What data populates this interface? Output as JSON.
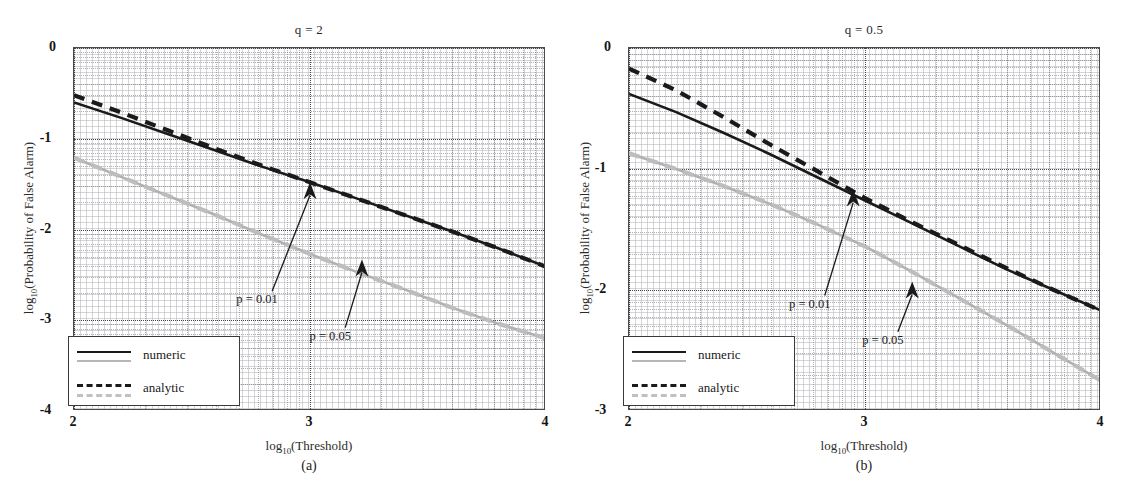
{
  "figure": {
    "width": 1137,
    "height": 485,
    "background": "#ffffff",
    "colors": {
      "numeric_black": "#1a1a1a",
      "numeric_gray": "#b0b0b0",
      "analytic_black": "#1a1a1a",
      "analytic_gray": "#bdbdbd",
      "axis": "#4a4a4a",
      "grid": "#787882",
      "text": "#1a1a1a"
    }
  },
  "chart_data": [
    {
      "type": "line",
      "panel": "a",
      "title": "q = 2",
      "subcaption": "(a)",
      "xlabel": "log10(Threshold)",
      "ylabel": "log10(Probability of False Alarm)",
      "xlim": [
        2,
        4
      ],
      "ylim": [
        -4,
        0
      ],
      "xticks": [
        2,
        3,
        4
      ],
      "xtick_labels": [
        "2",
        "3",
        "4"
      ],
      "yticks": [
        0,
        -1,
        -2,
        -3,
        -4
      ],
      "ytick_labels": [
        "0",
        "-1",
        "-2",
        "-3",
        "-4"
      ],
      "grid": "minor-dotted",
      "legend": {
        "position": "lower-left",
        "entries": [
          "numeric",
          "analytic"
        ]
      },
      "annotations": [
        {
          "text": "p = 0.01",
          "x": 2.78,
          "y": -2.78,
          "arrow_to_x": 3.0,
          "arrow_to_y": -1.48
        },
        {
          "text": "p = 0.05",
          "x": 3.09,
          "y": -3.18,
          "arrow_to_x": 3.22,
          "arrow_to_y": -2.33
        }
      ],
      "x": [
        2.0,
        2.2,
        2.4,
        2.6,
        2.8,
        3.0,
        3.2,
        3.4,
        3.6,
        3.8,
        4.0
      ],
      "series": [
        {
          "name": "numeric p=0.01",
          "color": "#1a1a1a",
          "style": "solid",
          "values": [
            -0.6,
            -0.77,
            -0.95,
            -1.13,
            -1.31,
            -1.48,
            -1.66,
            -1.84,
            -2.02,
            -2.21,
            -2.41
          ]
        },
        {
          "name": "analytic p=0.01",
          "color": "#1a1a1a",
          "style": "dashed",
          "values": [
            -0.52,
            -0.71,
            -0.91,
            -1.11,
            -1.3,
            -1.48,
            -1.66,
            -1.84,
            -2.02,
            -2.21,
            -2.41
          ]
        },
        {
          "name": "numeric p=0.05",
          "color": "#b0b0b0",
          "style": "solid",
          "values": [
            -1.21,
            -1.42,
            -1.63,
            -1.84,
            -2.06,
            -2.27,
            -2.47,
            -2.66,
            -2.86,
            -3.04,
            -3.2
          ]
        },
        {
          "name": "analytic p=0.05",
          "color": "#bdbdbd",
          "style": "dashed",
          "values": [
            -1.21,
            -1.42,
            -1.63,
            -1.84,
            -2.06,
            -2.27,
            -2.47,
            -2.66,
            -2.86,
            -3.04,
            -3.2
          ]
        }
      ]
    },
    {
      "type": "line",
      "panel": "b",
      "title": "q = 0.5",
      "subcaption": "(b)",
      "xlabel": "log10(Threshold)",
      "ylabel": "log10(Probability of False Alarm)",
      "xlim": [
        2,
        4
      ],
      "ylim": [
        -3,
        0
      ],
      "xticks": [
        2,
        3,
        4
      ],
      "xtick_labels": [
        "2",
        "3",
        "4"
      ],
      "yticks": [
        0,
        -1,
        -2,
        -3
      ],
      "ytick_labels": [
        "0",
        "-1",
        "-2",
        "-3"
      ],
      "grid": "minor-dotted",
      "legend": {
        "position": "lower-left",
        "entries": [
          "numeric",
          "analytic"
        ]
      },
      "annotations": [
        {
          "text": "p = 0.01",
          "x": 2.77,
          "y": -2.12,
          "arrow_to_x": 2.95,
          "arrow_to_y": -1.17
        },
        {
          "text": "p = 0.05",
          "x": 3.08,
          "y": -2.42,
          "arrow_to_x": 3.2,
          "arrow_to_y": -1.93
        }
      ],
      "x": [
        2.0,
        2.2,
        2.4,
        2.6,
        2.8,
        3.0,
        3.2,
        3.4,
        3.6,
        3.8,
        4.0
      ],
      "series": [
        {
          "name": "numeric p=0.01",
          "color": "#1a1a1a",
          "style": "solid",
          "values": [
            -0.38,
            -0.53,
            -0.7,
            -0.88,
            -1.07,
            -1.26,
            -1.45,
            -1.64,
            -1.83,
            -2.0,
            -2.17
          ]
        },
        {
          "name": "analytic p=0.01",
          "color": "#1a1a1a",
          "style": "dashed",
          "values": [
            -0.17,
            -0.35,
            -0.57,
            -0.8,
            -1.02,
            -1.24,
            -1.44,
            -1.63,
            -1.82,
            -2.0,
            -2.17
          ]
        },
        {
          "name": "numeric p=0.05",
          "color": "#b0b0b0",
          "style": "solid",
          "values": [
            -0.87,
            -1.0,
            -1.14,
            -1.29,
            -1.46,
            -1.64,
            -1.85,
            -2.07,
            -2.29,
            -2.52,
            -2.75
          ]
        },
        {
          "name": "analytic p=0.05",
          "color": "#bdbdbd",
          "style": "dashed",
          "values": [
            -0.87,
            -1.0,
            -1.14,
            -1.29,
            -1.46,
            -1.64,
            -1.85,
            -2.07,
            -2.29,
            -2.52,
            -2.75
          ]
        }
      ]
    }
  ],
  "legend": {
    "numeric": "numeric",
    "analytic": "analytic"
  },
  "labels": {
    "ylabel_prefix": "log",
    "ylabel_sub": "10",
    "ylabel_rest": "(Probability of False Alarm)",
    "xlabel_prefix": "log",
    "xlabel_sub": "10",
    "xlabel_rest": "(Threshold)"
  }
}
